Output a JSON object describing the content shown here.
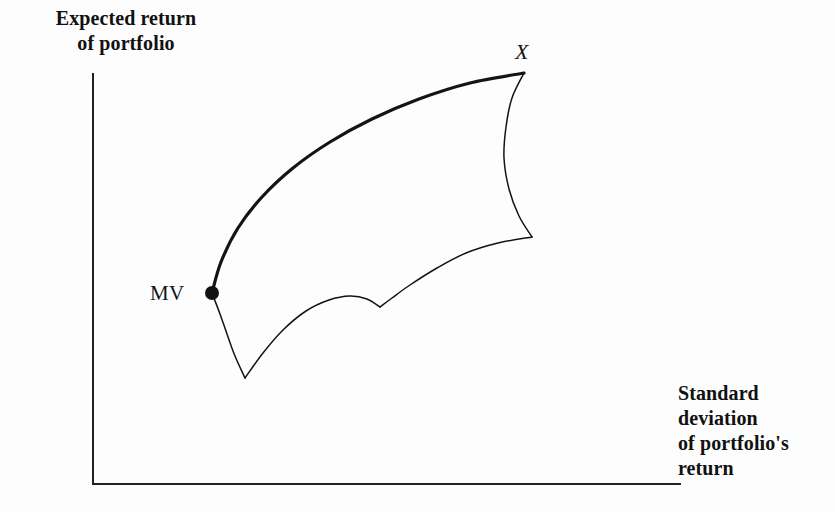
{
  "figure": {
    "kind": "efficient-frontier-diagram",
    "background_color": "#fdfdfd",
    "ink_color": "#141414"
  },
  "axes": {
    "y_label": "Expected return\nof portfolio",
    "x_label": "Standard\ndeviation\nof portfolio's\nreturn",
    "origin": {
      "x": 93,
      "y": 484
    },
    "y_axis_top": {
      "x": 93,
      "y": 74
    },
    "x_axis_right": {
      "x": 680,
      "y": 484
    },
    "line_width": 2,
    "ticks": [],
    "grid": false
  },
  "labels": {
    "mv": "MV",
    "x": "X"
  },
  "markers": [
    {
      "name": "mv-point",
      "label": "MV",
      "x": 212,
      "y": 293,
      "radius": 7,
      "fill": "#111111"
    }
  ],
  "chart_data": {
    "type": "line",
    "xlabel": "Standard deviation of portfolio's return",
    "ylabel": "Expected return of portfolio",
    "grid": false,
    "legend": null,
    "axis_ranges": {
      "x": [
        93,
        680
      ],
      "y": [
        484,
        74
      ]
    },
    "annotations": [
      {
        "text": "MV",
        "x": 212,
        "y": 293,
        "note": "minimum variance portfolio"
      },
      {
        "text": "X",
        "x": 524,
        "y": 73,
        "note": "maximum expected return portfolio"
      }
    ],
    "series": [
      {
        "name": "efficient-frontier",
        "style": "thick",
        "stroke_width": 3.2,
        "points": [
          {
            "x": 212,
            "y": 293
          },
          {
            "x": 221,
            "y": 262
          },
          {
            "x": 238,
            "y": 228
          },
          {
            "x": 262,
            "y": 197
          },
          {
            "x": 293,
            "y": 168
          },
          {
            "x": 330,
            "y": 142
          },
          {
            "x": 372,
            "y": 119
          },
          {
            "x": 419,
            "y": 99
          },
          {
            "x": 470,
            "y": 83
          },
          {
            "x": 524,
            "y": 73
          }
        ]
      },
      {
        "name": "right-boundary",
        "style": "thin",
        "stroke_width": 1.5,
        "points": [
          {
            "x": 524,
            "y": 73
          },
          {
            "x": 512,
            "y": 98
          },
          {
            "x": 506,
            "y": 127
          },
          {
            "x": 504,
            "y": 158
          },
          {
            "x": 509,
            "y": 189
          },
          {
            "x": 519,
            "y": 216
          },
          {
            "x": 532,
            "y": 237
          }
        ]
      },
      {
        "name": "lower-right-boundary",
        "style": "thin",
        "stroke_width": 1.5,
        "points": [
          {
            "x": 532,
            "y": 237
          },
          {
            "x": 498,
            "y": 243
          },
          {
            "x": 466,
            "y": 253
          },
          {
            "x": 437,
            "y": 268
          },
          {
            "x": 410,
            "y": 285
          },
          {
            "x": 392,
            "y": 298
          },
          {
            "x": 380,
            "y": 307
          }
        ]
      },
      {
        "name": "lower-left-boundary",
        "style": "thin",
        "stroke_width": 1.5,
        "points": [
          {
            "x": 380,
            "y": 307
          },
          {
            "x": 367,
            "y": 299
          },
          {
            "x": 350,
            "y": 296
          },
          {
            "x": 329,
            "y": 300
          },
          {
            "x": 306,
            "y": 311
          },
          {
            "x": 283,
            "y": 330
          },
          {
            "x": 263,
            "y": 353
          },
          {
            "x": 245,
            "y": 378
          }
        ]
      },
      {
        "name": "left-boundary",
        "style": "thin",
        "stroke_width": 1.5,
        "points": [
          {
            "x": 245,
            "y": 378
          },
          {
            "x": 235,
            "y": 356
          },
          {
            "x": 227,
            "y": 334
          },
          {
            "x": 220,
            "y": 314
          },
          {
            "x": 212,
            "y": 293
          }
        ]
      }
    ]
  }
}
